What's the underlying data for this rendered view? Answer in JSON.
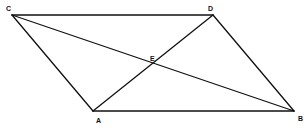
{
  "diagram": {
    "type": "parallelogram-with-diagonals",
    "points": {
      "A": {
        "x": 93,
        "y": 111,
        "label": "A",
        "lx": 96,
        "ly": 123
      },
      "B": {
        "x": 294,
        "y": 111,
        "label": "B",
        "lx": 298,
        "ly": 121
      },
      "C": {
        "x": 12,
        "y": 15,
        "label": "C",
        "lx": 6,
        "ly": 11
      },
      "D": {
        "x": 213,
        "y": 15,
        "label": "D",
        "lx": 208,
        "ly": 11
      },
      "E": {
        "x": 153,
        "y": 63,
        "label": "E",
        "lx": 150,
        "ly": 61
      }
    },
    "edges": [
      {
        "name": "side-CD",
        "from": "C",
        "to": "D"
      },
      {
        "name": "side-AB",
        "from": "A",
        "to": "B"
      },
      {
        "name": "side-CA",
        "from": "C",
        "to": "A"
      },
      {
        "name": "side-DB",
        "from": "D",
        "to": "B"
      },
      {
        "name": "diagonal-CB",
        "from": "C",
        "to": "B"
      },
      {
        "name": "diagonal-AD",
        "from": "A",
        "to": "D"
      }
    ],
    "stroke_color": "#111111",
    "background": "#ffffff"
  }
}
